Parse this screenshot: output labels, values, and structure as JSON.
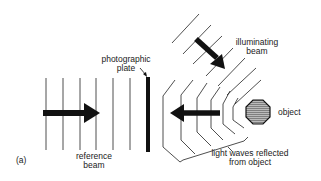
{
  "figure": {
    "panel_label": "(a)",
    "labels": {
      "photographic_plate": [
        "photographic",
        "plate"
      ],
      "illuminating_beam": [
        "illuminating",
        "beam"
      ],
      "object": "object",
      "reference_beam": [
        "reference",
        "beam"
      ],
      "reflected_waves": [
        "light waves reflected",
        "from object"
      ]
    },
    "colors": {
      "ink": "#111111",
      "background": "#ffffff"
    }
  }
}
